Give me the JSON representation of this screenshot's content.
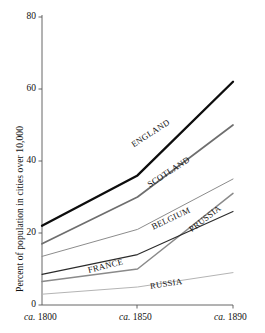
{
  "chart_data": {
    "type": "line",
    "title": "",
    "xlabel": "",
    "ylabel": "Percent of population in cities over 10,000",
    "x": [
      "ca. 1800",
      "ca. 1850",
      "ca. 1890"
    ],
    "xtick_labels": [
      "ca. 1800",
      "ca. 1850",
      "ca. 1890"
    ],
    "ytick_labels": [
      "0",
      "20",
      "40",
      "60",
      "80"
    ],
    "ytick_values": [
      0,
      20,
      40,
      60,
      80
    ],
    "ylim": [
      0,
      80
    ],
    "grid": false,
    "legend": "inline-labels-on-lines",
    "series": [
      {
        "name": "ENGLAND",
        "values": [
          22.0,
          36.0,
          62.0
        ],
        "color": "#0d0d0d",
        "width": 2.3,
        "label_angle": -33
      },
      {
        "name": "SCOTLAND",
        "values": [
          17.0,
          30.0,
          50.0
        ],
        "color": "#6e6e6e",
        "width": 1.7,
        "label_angle": -33
      },
      {
        "name": "BELGIUM",
        "values": [
          13.5,
          21.0,
          35.0
        ],
        "color": "#8c8c8c",
        "width": 1.0,
        "label_angle": -25
      },
      {
        "name": "PRUSSIA",
        "values": [
          6.5,
          10.0,
          31.0
        ],
        "color": "#8a8a8a",
        "width": 1.5,
        "label_angle": -38
      },
      {
        "name": "FRANCE",
        "values": [
          8.5,
          14.0,
          26.0
        ],
        "color": "#2b2b2b",
        "width": 1.1,
        "label_angle": -14
      },
      {
        "name": "RUSSIA",
        "values": [
          3.0,
          5.0,
          9.0
        ],
        "color": "#b4b4b4",
        "width": 1.0,
        "label_angle": -9
      }
    ],
    "series_labels": [
      {
        "name": "ENGLAND",
        "text": "ENGLAND",
        "x": 132,
        "y": 140,
        "angle": -33
      },
      {
        "name": "SCOTLAND",
        "text": "SCOTLAND",
        "x": 148,
        "y": 180,
        "angle": -33
      },
      {
        "name": "BELGIUM",
        "text": "BELGIUM",
        "x": 152,
        "y": 222,
        "angle": -25
      },
      {
        "name": "PRUSSIA",
        "text": "PRUSSIA",
        "x": 190,
        "y": 225,
        "angle": -38
      },
      {
        "name": "FRANCE",
        "text": "FRANCE",
        "x": 88,
        "y": 265,
        "angle": -14
      },
      {
        "name": "RUSSIA",
        "text": "RUSSIA",
        "x": 150,
        "y": 281,
        "angle": -9
      }
    ],
    "axis_colors": {
      "axis": "#555555",
      "text": "#111111",
      "background": "#ffffff"
    }
  }
}
